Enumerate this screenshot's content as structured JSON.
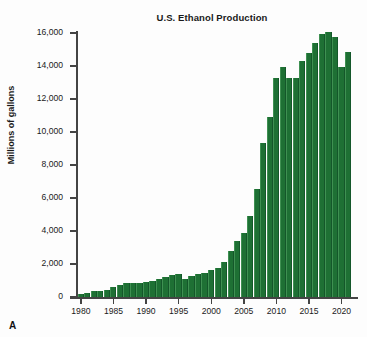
{
  "figure": {
    "panel_label": "A",
    "background_color": "#fdfdfd"
  },
  "chart_data": {
    "type": "bar",
    "title": "U.S. Ethanol Production",
    "xlabel": "",
    "ylabel": "Millions of gallons",
    "ylim": [
      0,
      16000
    ],
    "ytick_values": [
      0,
      2000,
      4000,
      6000,
      8000,
      10000,
      12000,
      14000,
      16000
    ],
    "ytick_labels": [
      "0",
      "2,000",
      "4,000",
      "6,000",
      "8,000",
      "10,000",
      "12,000",
      "14,000",
      "16,000"
    ],
    "xtick_values": [
      1980,
      1985,
      1990,
      1995,
      2000,
      2005,
      2010,
      2015,
      2020
    ],
    "xtick_labels": [
      "1980",
      "1985",
      "1990",
      "1995",
      "2000",
      "2005",
      "2010",
      "2015",
      "2020"
    ],
    "xlim": [
      1979.4,
      2021.6
    ],
    "grid": false,
    "legend": false,
    "bar_color": "#1e7034",
    "categories": [
      1980,
      1981,
      1982,
      1983,
      1984,
      1985,
      1986,
      1987,
      1988,
      1989,
      1990,
      1991,
      1992,
      1993,
      1994,
      1995,
      1996,
      1997,
      1998,
      1999,
      2000,
      2001,
      2002,
      2003,
      2004,
      2005,
      2006,
      2007,
      2008,
      2009,
      2010,
      2011,
      2012,
      2013,
      2014,
      2015,
      2016,
      2017,
      2018,
      2019,
      2020,
      2021
    ],
    "values": [
      175,
      215,
      350,
      375,
      430,
      610,
      710,
      830,
      845,
      870,
      900,
      950,
      1100,
      1200,
      1350,
      1400,
      1100,
      1300,
      1400,
      1470,
      1630,
      1770,
      2130,
      2800,
      3400,
      3904,
      4884,
      6521,
      9309,
      10938,
      13298,
      13929,
      13300,
      13300,
      14313,
      14807,
      15413,
      15936,
      16091,
      15778,
      13941,
      14866
    ]
  }
}
